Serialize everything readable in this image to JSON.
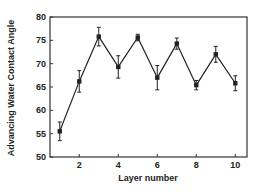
{
  "chart_data": {
    "type": "line",
    "title": "",
    "xlabel": "Layer number",
    "ylabel": "Advancing Water Contact Angle",
    "x": [
      1,
      2,
      3,
      4,
      5,
      6,
      7,
      8,
      9,
      10
    ],
    "series": [
      {
        "name": "Advancing water contact angle",
        "values": [
          55.5,
          66.2,
          75.8,
          69.3,
          75.6,
          67.0,
          74.3,
          65.4,
          72.0,
          65.8
        ],
        "errors": [
          2.0,
          2.3,
          2.0,
          2.4,
          0.7,
          2.6,
          1.2,
          1.0,
          1.7,
          1.6
        ],
        "marker": "filled-square",
        "color": "#222222"
      }
    ],
    "xlim": [
      0.5,
      10.6
    ],
    "ylim": [
      50,
      80
    ],
    "xticks": [
      2,
      4,
      6,
      8,
      10
    ],
    "yticks": [
      50,
      55,
      60,
      65,
      70,
      75,
      80
    ],
    "grid": false,
    "legend": "none"
  },
  "labels": {
    "xlabel": "Layer number",
    "ylabel": "Advancing Water Contact Angle"
  }
}
